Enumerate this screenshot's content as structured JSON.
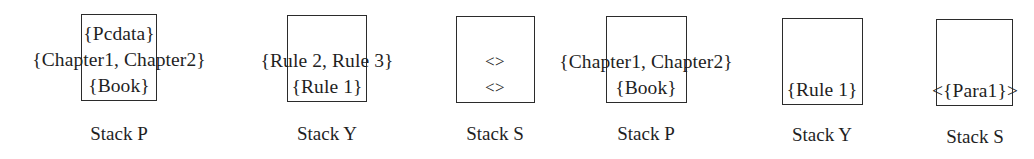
{
  "figure": {
    "type": "stack-state-diagram",
    "background_color": "#ffffff",
    "ink_color": "#1f1f1f",
    "border_color": "#2b2b2b",
    "stacks": [
      {
        "id": "stack-p-1",
        "caption": "Stack P",
        "lines": [
          "{Pcdata}",
          "{Chapter1, Chapter2}",
          "{Book}"
        ],
        "overflow_lines": [
          "{Chapter1, Chapter2}"
        ],
        "align": "bottom"
      },
      {
        "id": "stack-y-1",
        "caption": "Stack Y",
        "lines": [
          "{Rule 2, Rule 3}",
          "{Rule 1}"
        ],
        "overflow_lines": [
          "{Rule 2, Rule 3}"
        ],
        "align": "bottom"
      },
      {
        "id": "stack-s-1",
        "caption": "Stack S",
        "lines": [
          "<>",
          "<>"
        ],
        "overflow_lines": [],
        "align": "middle"
      },
      {
        "id": "stack-p-2",
        "caption": "Stack P",
        "lines": [
          "{Chapter1, Chapter2}",
          "{Book}"
        ],
        "overflow_lines": [
          "{Chapter1, Chapter2}"
        ],
        "align": "bottom"
      },
      {
        "id": "stack-y-2",
        "caption": "Stack Y",
        "lines": [
          "{Rule 1}"
        ],
        "overflow_lines": [],
        "align": "bottom"
      },
      {
        "id": "stack-s-2",
        "caption": "Stack S",
        "lines": [
          "<{Para1}>"
        ],
        "overflow_lines": [
          "<{Para1}>"
        ],
        "align": "bottom"
      }
    ]
  }
}
